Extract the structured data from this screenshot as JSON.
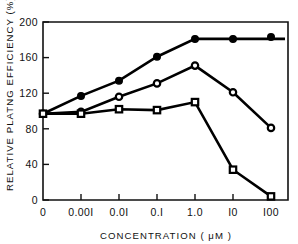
{
  "chart_data": {
    "type": "line",
    "title": "",
    "xlabel": "CONCENTRATION  ( μM )",
    "ylabel": "RELATIVE PLATNG EFFICIENCY (%)",
    "categories": [
      "0",
      "0.001",
      "0.01",
      "0.1",
      "1.0",
      "10",
      "100"
    ],
    "xtick_labels": [
      "0",
      "0.00I",
      "0.0I",
      "0.I",
      "1.0",
      "I0",
      "I00"
    ],
    "ytick_labels": [
      "0",
      "40",
      "80",
      "120",
      "160",
      "200"
    ],
    "ytick_values": [
      0,
      40,
      80,
      120,
      160,
      200
    ],
    "ylim": [
      0,
      200
    ],
    "grid": false,
    "legend": "none",
    "series": [
      {
        "name": "filled-circle-series",
        "marker": "filled-circle",
        "values": [
          97,
          117,
          134,
          161,
          181,
          181,
          183
        ],
        "detached_last_point": true
      },
      {
        "name": "open-circle-series",
        "marker": "open-circle",
        "values": [
          97,
          99,
          116,
          131,
          151,
          121,
          81
        ]
      },
      {
        "name": "open-square-series",
        "marker": "open-square",
        "values": [
          97,
          97,
          102,
          101,
          110,
          34,
          4
        ]
      }
    ]
  },
  "axes": {
    "y_axis_title": "RELATIVE PLATNG EFFICIENCY (%)",
    "x_axis_title_main": "CONCENTRATION",
    "x_axis_title_unit": "( μM )",
    "colors": {
      "line": "#000000",
      "marker_fill_open": "#ffffff",
      "background": "#ffffff"
    }
  }
}
